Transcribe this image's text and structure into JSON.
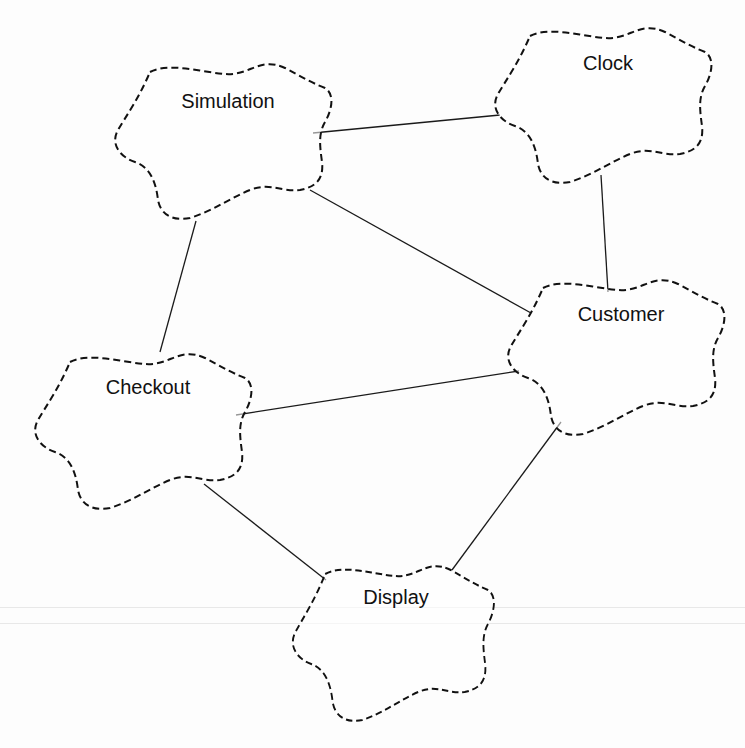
{
  "diagram": {
    "title": "",
    "nodes": [
      {
        "id": "simulation",
        "label": "Simulation"
      },
      {
        "id": "clock",
        "label": "Clock"
      },
      {
        "id": "customer",
        "label": "Customer"
      },
      {
        "id": "checkout",
        "label": "Checkout"
      },
      {
        "id": "display",
        "label": "Display"
      }
    ],
    "edges": [
      {
        "from": "simulation",
        "to": "clock"
      },
      {
        "from": "simulation",
        "to": "customer"
      },
      {
        "from": "simulation",
        "to": "checkout"
      },
      {
        "from": "clock",
        "to": "customer"
      },
      {
        "from": "checkout",
        "to": "customer"
      },
      {
        "from": "checkout",
        "to": "display"
      },
      {
        "from": "customer",
        "to": "display"
      }
    ],
    "style": {
      "node_shape": "dashed-cloud",
      "line_color": "#1a1a1a",
      "background": "#fdfdfd"
    }
  }
}
